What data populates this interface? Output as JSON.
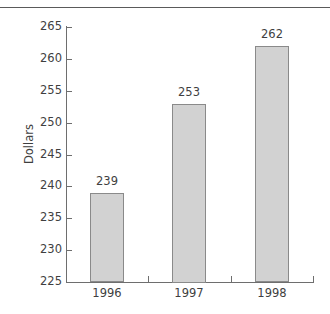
{
  "chart_data": {
    "type": "bar",
    "title": "",
    "subtitle": "",
    "categories": [
      "1996",
      "1997",
      "1998"
    ],
    "values": [
      239,
      253,
      262
    ],
    "data_labels": [
      "239",
      "253",
      "262"
    ],
    "xlabel": "",
    "ylabel": "Dollars",
    "ylim": [
      225,
      265
    ],
    "ytick_values": [
      225,
      230,
      235,
      240,
      245,
      250,
      255,
      260,
      265
    ],
    "ytick_labels": [
      "225",
      "230",
      "235",
      "240",
      "245",
      "250",
      "255",
      "260",
      "265"
    ],
    "grid": false,
    "legend": null,
    "bar_fill_color": "#d2d2d2",
    "bar_border_color": "#8a8a8a",
    "axis_color": "#6e6e6e",
    "text_color": "#3f3f3f"
  },
  "figure": {
    "top_rule": true
  }
}
